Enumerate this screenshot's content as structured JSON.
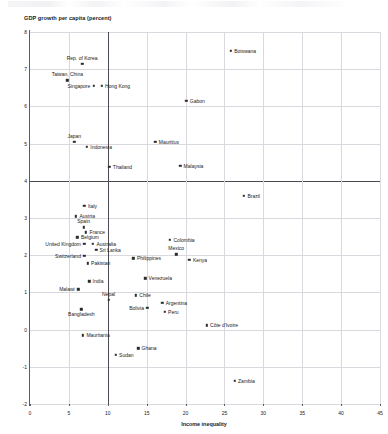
{
  "chart_data": {
    "type": "scatter",
    "title": "",
    "xlabel": "Income inequality",
    "ylabel": "GDP growth per capita (percent)",
    "xlim": [
      0,
      45
    ],
    "ylim": [
      -2,
      8
    ],
    "xticks": [
      0,
      5,
      10,
      15,
      20,
      25,
      30,
      35,
      40,
      45
    ],
    "yticks": [
      -2,
      -1,
      0,
      1,
      2,
      3,
      4,
      5,
      6,
      7,
      8
    ],
    "grid": true,
    "emphasis_lines": {
      "horizontal": 4,
      "vertical": 10
    },
    "legend": "none",
    "points": [
      {
        "name": "Rep. of Korea",
        "x": 6.7,
        "y": 7.15,
        "lpos": "t"
      },
      {
        "name": "Taiwan, China",
        "x": 4.8,
        "y": 6.7,
        "lpos": "t"
      },
      {
        "name": "Singapore",
        "x": 8.2,
        "y": 6.55,
        "lpos": "l"
      },
      {
        "name": "Hong Kong",
        "x": 9.2,
        "y": 6.55,
        "lpos": "r"
      },
      {
        "name": "Botswana",
        "x": 25.8,
        "y": 7.5,
        "lpos": "r"
      },
      {
        "name": "Gabon",
        "x": 20.1,
        "y": 6.15,
        "lpos": "r"
      },
      {
        "name": "Japan",
        "x": 5.7,
        "y": 5.05,
        "lpos": "t"
      },
      {
        "name": "Indonesia",
        "x": 7.3,
        "y": 4.92,
        "lpos": "r"
      },
      {
        "name": "Mauritius",
        "x": 16.1,
        "y": 5.05,
        "lpos": "r"
      },
      {
        "name": "Thailand",
        "x": 10.2,
        "y": 4.38,
        "lpos": "r"
      },
      {
        "name": "Malaysia",
        "x": 19.3,
        "y": 4.4,
        "lpos": "r"
      },
      {
        "name": "Brazil",
        "x": 27.5,
        "y": 3.6,
        "lpos": "r"
      },
      {
        "name": "Italy",
        "x": 7.0,
        "y": 3.32,
        "lpos": "r"
      },
      {
        "name": "Austria",
        "x": 5.9,
        "y": 3.05,
        "lpos": "r"
      },
      {
        "name": "Spain",
        "x": 6.9,
        "y": 2.75,
        "lpos": "t"
      },
      {
        "name": "France",
        "x": 7.2,
        "y": 2.62,
        "lpos": "r"
      },
      {
        "name": "Belgium",
        "x": 6.1,
        "y": 2.48,
        "lpos": "r"
      },
      {
        "name": "United Kingdom",
        "x": 7.0,
        "y": 2.3,
        "lpos": "l"
      },
      {
        "name": "Australia",
        "x": 8.1,
        "y": 2.3,
        "lpos": "r"
      },
      {
        "name": "Sri Lanka",
        "x": 8.5,
        "y": 2.15,
        "lpos": "r"
      },
      {
        "name": "Switzerland",
        "x": 7.0,
        "y": 1.98,
        "lpos": "l"
      },
      {
        "name": "Pakistan",
        "x": 7.4,
        "y": 1.78,
        "lpos": "r"
      },
      {
        "name": "Philippines",
        "x": 13.3,
        "y": 1.92,
        "lpos": "r"
      },
      {
        "name": "Colombia",
        "x": 18.0,
        "y": 2.42,
        "lpos": "r"
      },
      {
        "name": "Mexico",
        "x": 18.8,
        "y": 2.02,
        "lpos": "t"
      },
      {
        "name": "Kenya",
        "x": 20.5,
        "y": 1.88,
        "lpos": "r"
      },
      {
        "name": "Venezuela",
        "x": 14.8,
        "y": 1.38,
        "lpos": "r"
      },
      {
        "name": "India",
        "x": 7.6,
        "y": 1.3,
        "lpos": "r"
      },
      {
        "name": "Malawi",
        "x": 6.2,
        "y": 1.08,
        "lpos": "l"
      },
      {
        "name": "Nepal",
        "x": 10.1,
        "y": 0.8,
        "lpos": "t"
      },
      {
        "name": "Chile",
        "x": 13.6,
        "y": 0.92,
        "lpos": "r"
      },
      {
        "name": "Bolivia",
        "x": 15.1,
        "y": 0.58,
        "lpos": "l"
      },
      {
        "name": "Argentina",
        "x": 17.0,
        "y": 0.72,
        "lpos": "r"
      },
      {
        "name": "Peru",
        "x": 17.3,
        "y": 0.48,
        "lpos": "r"
      },
      {
        "name": "Bangladesh",
        "x": 6.6,
        "y": 0.55,
        "lpos": "b"
      },
      {
        "name": "Côte d'Ivoire",
        "x": 22.7,
        "y": 0.12,
        "lpos": "r"
      },
      {
        "name": "Mauritania",
        "x": 6.8,
        "y": -0.15,
        "lpos": "r"
      },
      {
        "name": "Ghana",
        "x": 13.9,
        "y": -0.5,
        "lpos": "r"
      },
      {
        "name": "Sudan",
        "x": 11.0,
        "y": -0.68,
        "lpos": "r"
      },
      {
        "name": "Zambia",
        "x": 26.3,
        "y": -1.38,
        "lpos": "r"
      }
    ]
  }
}
